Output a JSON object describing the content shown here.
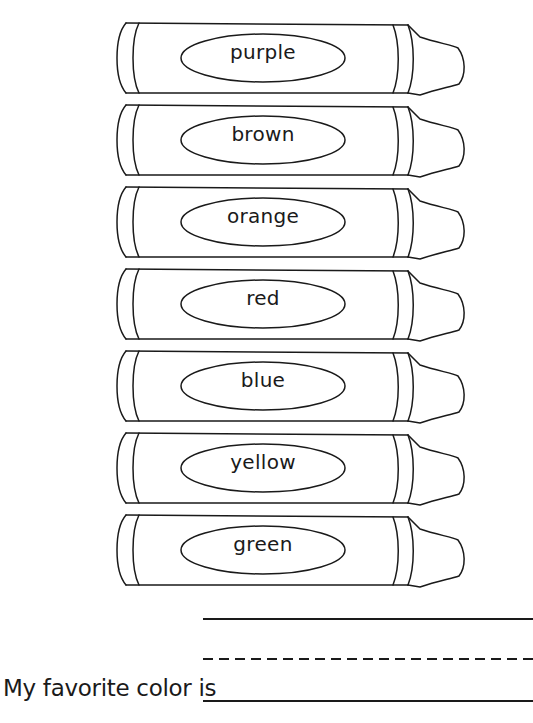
{
  "worksheet": {
    "crayons": [
      {
        "label": "purple"
      },
      {
        "label": "brown"
      },
      {
        "label": "orange"
      },
      {
        "label": "red"
      },
      {
        "label": "blue"
      },
      {
        "label": "yellow"
      },
      {
        "label": "green"
      }
    ],
    "prompt": "My favorite color is",
    "colors": {
      "ink": "#1a1a1a",
      "background": "#ffffff"
    }
  }
}
